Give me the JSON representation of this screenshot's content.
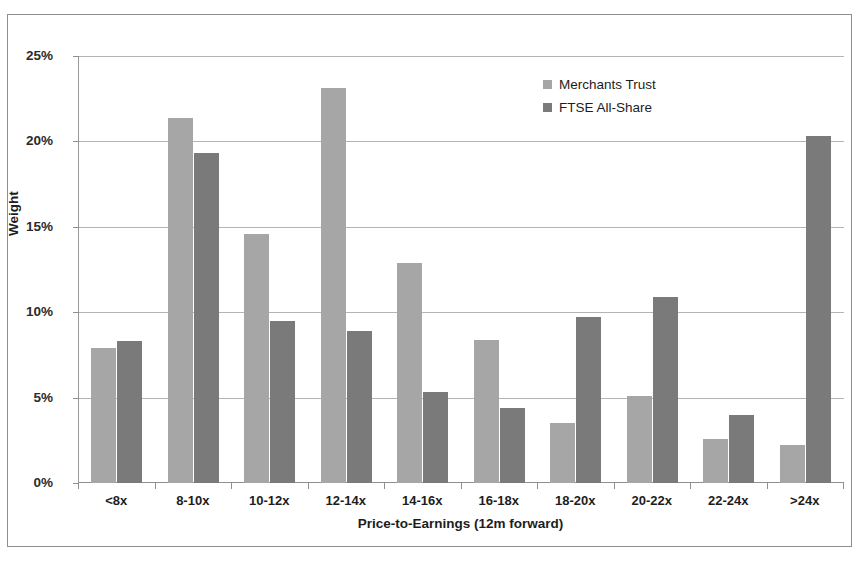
{
  "chart_data": {
    "type": "bar",
    "title": "",
    "xlabel": "Price-to-Earnings (12m forward)",
    "ylabel": "Weight",
    "ylim": [
      0,
      25
    ],
    "ytick_labels": [
      "0%",
      "5%",
      "10%",
      "15%",
      "20%",
      "25%"
    ],
    "ytick_values": [
      0,
      5,
      10,
      15,
      20,
      25
    ],
    "grid": true,
    "legend_position": "top-right",
    "categories": [
      "<8x",
      "8-10x",
      "10-12x",
      "12-14x",
      "14-16x",
      "16-18x",
      "18-20x",
      "20-22x",
      "22-24x",
      ">24x"
    ],
    "series": [
      {
        "name": "Merchants Trust",
        "color": "#a6a6a6",
        "values": [
          7.9,
          21.4,
          14.6,
          23.1,
          12.9,
          8.4,
          3.5,
          5.1,
          2.6,
          2.2
        ]
      },
      {
        "name": "FTSE All-Share",
        "color": "#7a7a7a",
        "values": [
          8.3,
          19.3,
          9.5,
          8.9,
          5.3,
          4.4,
          9.7,
          10.9,
          4.0,
          20.3
        ]
      }
    ]
  },
  "colors": {
    "merchants_trust": "#a6a6a6",
    "ftse_all_share": "#7a7a7a",
    "gridline": "#b4b4b4",
    "axis": "#8f8f8f",
    "frame_border": "#8e8e8e",
    "background": "#ffffff"
  }
}
